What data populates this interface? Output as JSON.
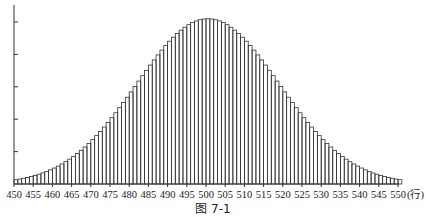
{
  "chart_data": {
    "type": "bar",
    "title": "",
    "caption": "图 7-1",
    "xlabel": "(行)",
    "ylabel": "",
    "x_range": [
      450,
      550
    ],
    "x_ticks": [
      450,
      455,
      460,
      465,
      470,
      475,
      480,
      485,
      490,
      495,
      500,
      505,
      510,
      515,
      520,
      525,
      530,
      535,
      540,
      545,
      550
    ],
    "y_ticks_count": 5,
    "y_tick_labels": [],
    "grid": false,
    "legend": null,
    "distribution": {
      "shape": "normal",
      "mean": 500,
      "sigma": 18.5,
      "peak_height_in_tick_units": 5.1
    },
    "note": "Histogram of a bell-shaped (normal) distribution with one bar per integer from 450 to 550; y-axis has 5 unlabeled evenly spaced ticks. Bar heights expressed in y-tick units."
  },
  "axis": {
    "x_unit_label": "(行)"
  },
  "figure": {
    "caption": "图 7-1"
  },
  "colors": {
    "stroke": "#333333",
    "background": "#ffffff"
  }
}
